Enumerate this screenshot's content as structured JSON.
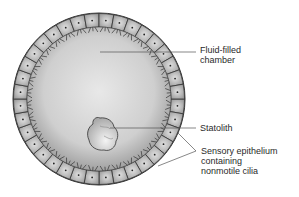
{
  "diagram": {
    "labels": {
      "fluid_chamber": "Fluid-filled\nchamber",
      "statolith": "Statolith",
      "sensory_epithelium": "Sensory epithelium\ncontaining\nnonmotile cilia"
    },
    "colors": {
      "chamber_center": "#e6e6e6",
      "chamber_edge": "#a8a8a8",
      "cell_fill": "#c4c4c4",
      "outline": "#333333",
      "leader_line": "#555555",
      "text": "#2a2a2a"
    }
  }
}
